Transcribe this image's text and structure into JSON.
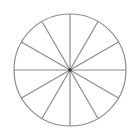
{
  "diagram": {
    "type": "divided-circle",
    "sectors": 12,
    "center": [
      70,
      70
    ],
    "radius": 56,
    "stroke_color": "#8c8c8c",
    "center_dot_color": "#333333",
    "background": "#ffffff"
  }
}
